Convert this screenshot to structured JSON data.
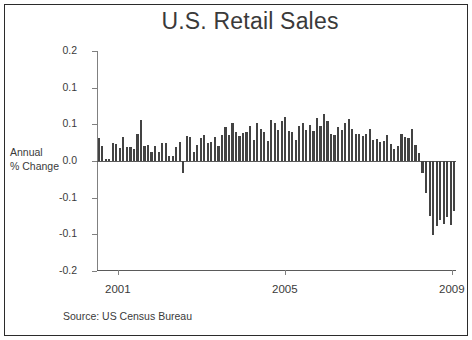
{
  "figure": {
    "title": "U.S. Retail Sales",
    "source": "Source:  US Census Bureau",
    "axis_label_line1": "Annual",
    "axis_label_line2": "% Change",
    "bar_color": "#434343",
    "axis_color": "#808080",
    "text_color": "#3a3a3a",
    "background": "#ffffff",
    "border_color": "#2b2b2b"
  },
  "chart_data": {
    "type": "bar",
    "title": "U.S. Retail Sales",
    "subtitle": "",
    "xlabel": "",
    "ylabel": "Annual % Change",
    "ylim": [
      -0.2,
      0.2
    ],
    "grid": false,
    "legend": "none",
    "annotations": [
      "Source:  US Census Bureau"
    ],
    "ytick_labels": [
      "0.2",
      "0.1",
      "0.1",
      "0.0",
      "-0.1",
      "-0.1",
      "-0.2"
    ],
    "ytick_values": [
      0.2,
      0.15,
      0.1,
      0.05,
      0.0,
      -0.05,
      -0.1,
      -0.15,
      -0.2
    ],
    "ytick_values_drawn": [
      0.2,
      0.133,
      0.067,
      0.0,
      -0.067,
      -0.133,
      -0.2
    ],
    "xtick_labels": [
      "2001",
      "2005",
      "2009"
    ],
    "xtick_values": [
      2001,
      2005,
      2009
    ],
    "xlim": [
      2001.0,
      2009.6
    ],
    "x_start_year": 2001,
    "frequency": "monthly",
    "categories": [
      "2001-01",
      "2001-02",
      "2001-03",
      "2001-04",
      "2001-05",
      "2001-06",
      "2001-07",
      "2001-08",
      "2001-09",
      "2001-10",
      "2001-11",
      "2001-12",
      "2002-01",
      "2002-02",
      "2002-03",
      "2002-04",
      "2002-05",
      "2002-06",
      "2002-07",
      "2002-08",
      "2002-09",
      "2002-10",
      "2002-11",
      "2002-12",
      "2003-01",
      "2003-02",
      "2003-03",
      "2003-04",
      "2003-05",
      "2003-06",
      "2003-07",
      "2003-08",
      "2003-09",
      "2003-10",
      "2003-11",
      "2003-12",
      "2004-01",
      "2004-02",
      "2004-03",
      "2004-04",
      "2004-05",
      "2004-06",
      "2004-07",
      "2004-08",
      "2004-09",
      "2004-10",
      "2004-11",
      "2004-12",
      "2005-01",
      "2005-02",
      "2005-03",
      "2005-04",
      "2005-05",
      "2005-06",
      "2005-07",
      "2005-08",
      "2005-09",
      "2005-10",
      "2005-11",
      "2005-12",
      "2006-01",
      "2006-02",
      "2006-03",
      "2006-04",
      "2006-05",
      "2006-06",
      "2006-07",
      "2006-08",
      "2006-09",
      "2006-10",
      "2006-11",
      "2006-12",
      "2007-01",
      "2007-02",
      "2007-03",
      "2007-04",
      "2007-05",
      "2007-06",
      "2007-07",
      "2007-08",
      "2007-09",
      "2007-10",
      "2007-11",
      "2007-12",
      "2008-01",
      "2008-02",
      "2008-03",
      "2008-04",
      "2008-05",
      "2008-06",
      "2008-07",
      "2008-08",
      "2008-09",
      "2008-10",
      "2008-11",
      "2008-12",
      "2009-01",
      "2009-02",
      "2009-03",
      "2009-04",
      "2009-05",
      "2009-06"
    ],
    "values": [
      0.041,
      0.027,
      0.003,
      0.003,
      0.033,
      0.031,
      0.024,
      0.044,
      0.026,
      0.026,
      0.022,
      0.05,
      0.075,
      0.028,
      0.029,
      0.016,
      0.027,
      0.016,
      0.032,
      0.033,
      0.009,
      0.01,
      0.026,
      0.035,
      -0.022,
      0.046,
      0.043,
      0.017,
      0.029,
      0.041,
      0.047,
      0.033,
      0.034,
      0.043,
      0.028,
      0.048,
      0.061,
      0.048,
      0.069,
      0.053,
      0.045,
      0.051,
      0.052,
      0.064,
      0.039,
      0.069,
      0.058,
      0.052,
      0.037,
      0.075,
      0.07,
      0.056,
      0.072,
      0.08,
      0.054,
      0.052,
      0.038,
      0.064,
      0.069,
      0.056,
      0.065,
      0.054,
      0.079,
      0.063,
      0.085,
      0.073,
      0.05,
      0.047,
      0.061,
      0.056,
      0.07,
      0.076,
      0.059,
      0.05,
      0.049,
      0.046,
      0.049,
      0.058,
      0.038,
      0.04,
      0.034,
      0.036,
      0.047,
      0.031,
      0.021,
      0.028,
      0.05,
      0.044,
      0.042,
      0.059,
      0.03,
      0.015,
      -0.021,
      -0.058,
      -0.1,
      -0.135,
      -0.118,
      -0.108,
      -0.115,
      -0.101,
      -0.116,
      -0.09
    ],
    "series": [
      {
        "name": "U.S. Retail Sales annual % change",
        "color": "#434343"
      }
    ]
  }
}
